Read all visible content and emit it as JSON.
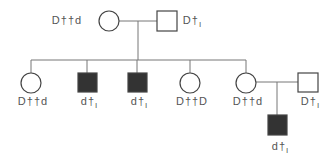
{
  "diagram": {
    "type": "pedigree",
    "colors": {
      "line": "#777777",
      "affected": "#333333",
      "unaffected": "#ffffff",
      "text": "#555555"
    },
    "generation_1": [
      {
        "id": "mother",
        "sex": "female",
        "affected": false,
        "label": "D††d"
      },
      {
        "id": "father",
        "sex": "male",
        "affected": false,
        "label": "D†",
        "label_sub": "I"
      }
    ],
    "generation_2": [
      {
        "id": "daughter-1",
        "sex": "female",
        "affected": false,
        "label": "D††d"
      },
      {
        "id": "son-1",
        "sex": "male",
        "affected": true,
        "label": "d†",
        "label_sub": "I"
      },
      {
        "id": "son-2",
        "sex": "male",
        "affected": true,
        "label": "d†",
        "label_sub": "I"
      },
      {
        "id": "daughter-2",
        "sex": "female",
        "affected": false,
        "label": "D††D"
      },
      {
        "id": "daughter-3",
        "sex": "female",
        "affected": false,
        "label": "D††d"
      },
      {
        "id": "spouse",
        "sex": "male",
        "affected": false,
        "label": "D†",
        "label_sub": "I"
      }
    ],
    "generation_3": [
      {
        "id": "grandson",
        "sex": "male",
        "affected": true,
        "label": "d†",
        "label_sub": "I"
      }
    ]
  }
}
